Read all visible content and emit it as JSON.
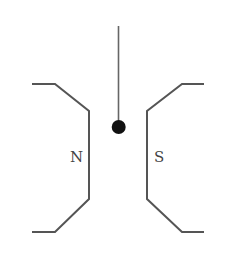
{
  "diagram": {
    "type": "magnet-pendulum",
    "labels": {
      "north": "N",
      "south": "S"
    },
    "colors": {
      "pole_stroke": "#555555",
      "string_stroke": "#666666",
      "ball_fill": "#111111",
      "label_color": "#444444",
      "background": "#ffffff"
    }
  }
}
